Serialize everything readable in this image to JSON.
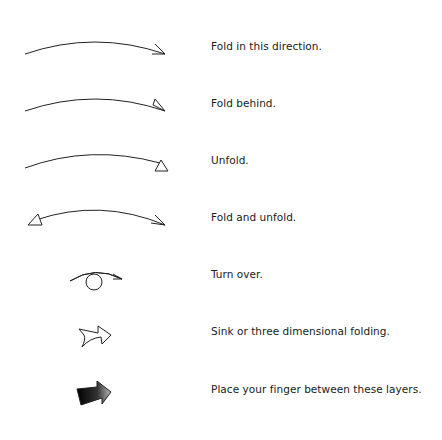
{
  "legend": {
    "items": [
      {
        "symbol": "valley-fold-arrow-icon",
        "label": "Fold in this direction."
      },
      {
        "symbol": "mountain-fold-arrow-icon",
        "label": "Fold behind."
      },
      {
        "symbol": "unfold-arrow-icon",
        "label": "Unfold."
      },
      {
        "symbol": "fold-and-unfold-arrow-icon",
        "label": "Fold and unfold."
      },
      {
        "symbol": "turn-over-arrow-icon",
        "label": "Turn over."
      },
      {
        "symbol": "sink-arrow-icon",
        "label": "Sink or three dimensional folding."
      },
      {
        "symbol": "finger-between-layers-arrow-icon",
        "label": "Place your finger between these layers."
      }
    ]
  },
  "colors": {
    "stroke": "#222222",
    "text": "#1a1a1a",
    "background": "#ffffff"
  }
}
